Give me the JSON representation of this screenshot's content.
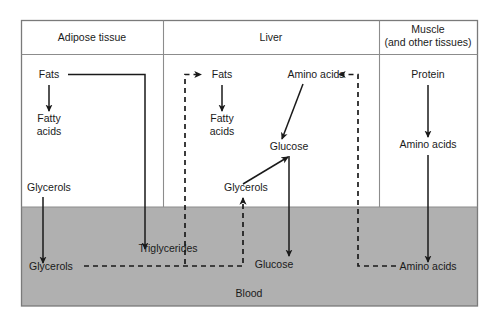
{
  "diagram": {
    "type": "flow-diagram",
    "colors": {
      "blood_fill": "#b0b0b0",
      "frame_stroke": "#8c8c8c",
      "arrow_stroke": "#1a1a1a",
      "background": "#ffffff",
      "text": "#1a1a1a"
    },
    "headers": [
      {
        "id": "adipose",
        "label": "Adipose tissue"
      },
      {
        "id": "liver",
        "label": "Liver"
      },
      {
        "id": "muscle",
        "label_line1": "Muscle",
        "label_line2": "(and other tissues)"
      }
    ],
    "blood_label": "Blood",
    "nodes": {
      "adipose_fats": "Fats",
      "adipose_fatty_line1": "Fatty",
      "adipose_fatty_line2": "acids",
      "adipose_glycerols": "Glycerols",
      "liver_fats": "Fats",
      "liver_fatty_line1": "Fatty",
      "liver_fatty_line2": "acids",
      "liver_amino_acids": "Amino acids",
      "liver_glucose": "Glucose",
      "liver_glycerols": "Glycerols",
      "muscle_protein": "Protein",
      "muscle_amino_acids": "Amino acids",
      "blood_glycerols": "Glycerols",
      "blood_triglycerides": "Triglycerides",
      "blood_glucose": "Glucose",
      "blood_amino_acids": "Amino acids"
    },
    "flows": [
      {
        "id": "adipose-fats-to-fatty-acids",
        "style": "solid",
        "from": "Fats",
        "to": "Fatty acids"
      },
      {
        "id": "adipose-fats-to-blood-triglycerides",
        "style": "solid",
        "from": "Fats",
        "to": "Triglycerides"
      },
      {
        "id": "adipose-glycerols-to-blood-glycerols",
        "style": "solid",
        "from": "Glycerols",
        "to": "Glycerols"
      },
      {
        "id": "blood-glycerols-to-liver-glycerols",
        "style": "dashed",
        "from": "Glycerols",
        "to": "Glycerols"
      },
      {
        "id": "blood-triglycerides-to-liver-fats",
        "style": "dashed",
        "from": "Triglycerides",
        "to": "Fats"
      },
      {
        "id": "liver-fats-to-fatty-acids",
        "style": "solid",
        "from": "Fats",
        "to": "Fatty acids"
      },
      {
        "id": "liver-glycerols-to-glucose",
        "style": "solid",
        "from": "Glycerols",
        "to": "Glucose"
      },
      {
        "id": "liver-amino-acids-to-glucose",
        "style": "solid",
        "from": "Amino acids",
        "to": "Glucose"
      },
      {
        "id": "liver-glucose-to-blood-glucose",
        "style": "solid",
        "from": "Glucose",
        "to": "Glucose"
      },
      {
        "id": "muscle-protein-to-amino-acids",
        "style": "solid",
        "from": "Protein",
        "to": "Amino acids"
      },
      {
        "id": "muscle-amino-acids-to-blood-amino-acids",
        "style": "solid",
        "from": "Amino acids",
        "to": "Amino acids"
      },
      {
        "id": "blood-amino-acids-to-liver-amino-acids",
        "style": "dashed",
        "from": "Amino acids",
        "to": "Amino acids"
      }
    ]
  }
}
